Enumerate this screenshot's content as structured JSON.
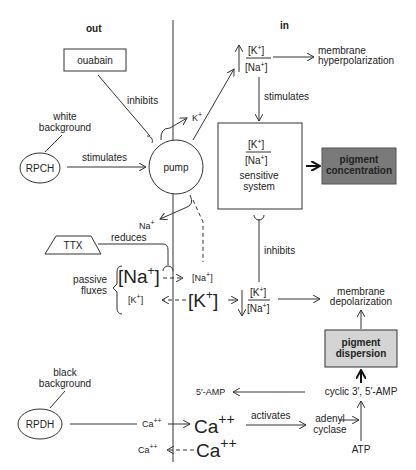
{
  "regions": {
    "out": "out",
    "in": "in"
  },
  "nodes": {
    "ouabain": "ouabain",
    "white_background": [
      "white",
      "background"
    ],
    "rpch": "RPCH",
    "pump": "pump",
    "ttx": "TTX",
    "black_background": [
      "black",
      "background"
    ],
    "rpdh": "RPDH",
    "sensitive_system": [
      "sensitive",
      "system"
    ],
    "pigment_concentration": [
      "pigment",
      "concentration"
    ],
    "pigment_dispersion": [
      "pigment",
      "dispersion"
    ],
    "membrane_hyperpolarization": [
      "membrane",
      "hyperpolarization"
    ],
    "membrane_depolarization": [
      "membrane",
      "depolarization"
    ],
    "adenyl_cyclase": [
      "adenyl",
      "cyclase"
    ],
    "atp": "ATP",
    "cyclic_amp": "cyclic 3′, 5′-AMP",
    "five_amp": "5′-AMP"
  },
  "edge_labels": {
    "inhibits_top": "inhibits",
    "stimulates_rpch": "stimulates",
    "stimulates_ratio": "stimulates",
    "reduces": "reduces",
    "inhibits_mid": "inhibits",
    "activates": "activates",
    "passive_fluxes": [
      "passive",
      "fluxes"
    ]
  },
  "ions": {
    "k_plus": "K",
    "na_plus": "Na",
    "ca": "Ca",
    "plus": "+",
    "plusplus": "++"
  },
  "colors": {
    "pigment_concentration_fill": "#7a7a7a",
    "pigment_dispersion_fill": "#d4d4d4",
    "line": "#333333"
  }
}
